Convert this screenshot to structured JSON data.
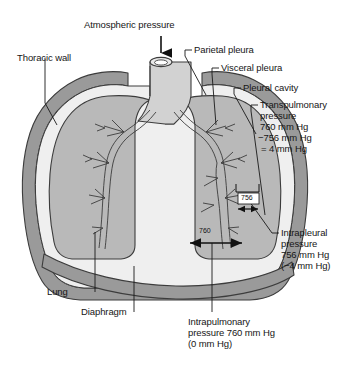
{
  "figure": {
    "type": "anatomical-diagram",
    "background_color": "#ffffff"
  },
  "colors": {
    "thoracic_wall": "#9a9a9a",
    "pleural_cavity": "#efefef",
    "lung": "#b9b9b9",
    "trachea": "#d2d2d2",
    "outline": "#3c3c3c",
    "text": "#161616",
    "leader_line": "#1a1a1a"
  },
  "labels": {
    "atmospheric_pressure": "Atmospheric pressure",
    "parietal_pleura": "Parietal pleura",
    "visceral_pleura": "Visceral pleura",
    "pleural_cavity": "Pleural cavity",
    "thoracic_wall": "Thoracic wall",
    "lung": "Lung",
    "diaphragm": "Diaphragm"
  },
  "callouts": {
    "transpulmonary": {
      "line1": "Transpulmonary",
      "line2": "pressure",
      "line3": "760 mm Hg",
      "line4": "−756 mm Hg",
      "line5": "= 4 mm Hg",
      "block": "Transpulmonary\npressure\n760 mm Hg"
    },
    "intrapleural": {
      "line1": "Intrapleural",
      "line2": "pressure",
      "line3": "756 mm Hg",
      "line4": "(−4 mm Hg)",
      "block": "Intrapleural\npressure\n756 mm Hg\n(−4 mm Hg)"
    },
    "intrapulmonary": {
      "line1": "Intrapulmonary",
      "line2": "pressure 760 mm Hg",
      "line3": "(0 mm Hg)",
      "block": "Intrapulmonary\npressure 760 mm Hg\n(0 mm Hg)"
    }
  },
  "measurements": {
    "intrapleural_value": "756",
    "intrapulmonary_value": "760"
  }
}
